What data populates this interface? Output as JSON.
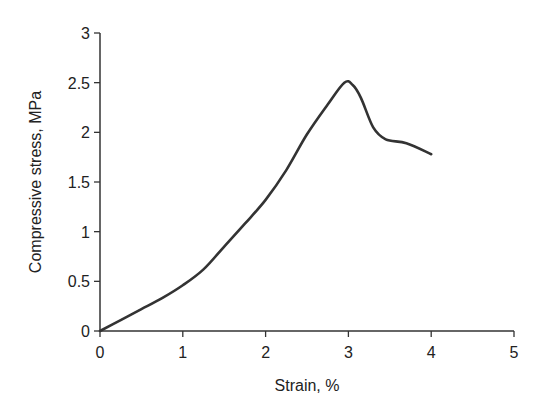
{
  "chart_data": {
    "type": "line",
    "title": "",
    "xlabel": "Strain, %",
    "ylabel": "Compressive stress, MPa",
    "xlim": [
      0,
      5
    ],
    "ylim": [
      0,
      3
    ],
    "xticks": [
      0,
      1,
      2,
      3,
      4,
      5
    ],
    "xtick_labels": [
      "0",
      "1",
      "2",
      "3",
      "4",
      "5"
    ],
    "yticks": [
      0,
      0.5,
      1,
      1.5,
      2,
      2.5,
      3
    ],
    "ytick_labels": [
      "0",
      "0.5",
      "1",
      "1.5",
      "2",
      "2.5",
      "3"
    ],
    "grid": false,
    "legend": null,
    "series": [
      {
        "name": "Compressive stress-strain curve",
        "color": "#333333",
        "x": [
          0,
          0.25,
          0.5,
          0.75,
          1.0,
          1.25,
          1.5,
          1.75,
          2.0,
          2.25,
          2.5,
          2.75,
          2.95,
          3.05,
          3.15,
          3.3,
          3.45,
          3.7,
          4.0
        ],
        "y": [
          0,
          0.11,
          0.22,
          0.33,
          0.46,
          0.62,
          0.85,
          1.08,
          1.32,
          1.62,
          1.98,
          2.28,
          2.5,
          2.48,
          2.35,
          2.05,
          1.93,
          1.89,
          1.78
        ]
      }
    ]
  }
}
